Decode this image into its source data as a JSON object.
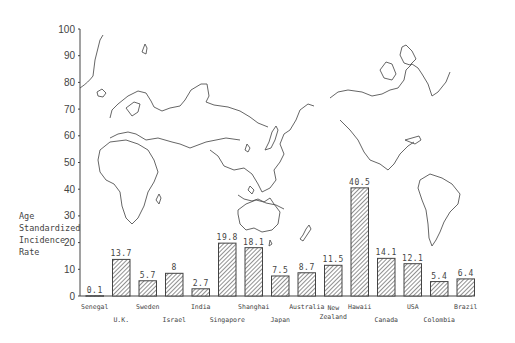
{
  "chart_data": {
    "type": "bar",
    "title": "",
    "xlabel": "",
    "ylabel": "Age Standardized Incidence Rate",
    "ylabel_lines": [
      "Age",
      "Standardized",
      "Incidence",
      "Rate"
    ],
    "ylim": [
      0,
      100
    ],
    "yticks": [
      0,
      10,
      20,
      30,
      40,
      50,
      60,
      70,
      80,
      90,
      100
    ],
    "grid": false,
    "legend": null,
    "background": "world map outline (Pacific-centered)",
    "bar_fill": "diagonal hatch",
    "categories": [
      "Senegal",
      "U.K.",
      "Sweden",
      "Israel",
      "India",
      "Singapore",
      "Shanghai",
      "Japan",
      "Australia",
      "New Zealand",
      "Hawaii",
      "Canada",
      "USA",
      "Colombia",
      "Brazil"
    ],
    "values": [
      0.1,
      13.7,
      5.7,
      8.5,
      2.7,
      19.8,
      18.1,
      7.5,
      8.7,
      11.5,
      40.5,
      14.1,
      12.1,
      5.4,
      6.4
    ],
    "value_labels": [
      "0.1",
      "13.7",
      "5.7",
      "8",
      "2.7",
      "19.8",
      "18.1",
      "7.5",
      "8.7",
      "11.5",
      "40.5",
      "14.1",
      "12.1",
      "5.4",
      "6.4"
    ],
    "category_label_rows": [
      0,
      1,
      0,
      1,
      0,
      1,
      0,
      1,
      0,
      1,
      0,
      1,
      0,
      1,
      0
    ]
  }
}
